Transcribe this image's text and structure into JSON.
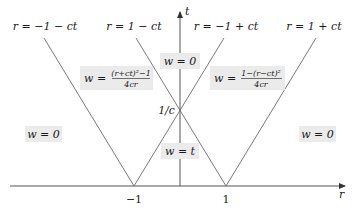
{
  "diagram": {
    "type": "characteristic-lines-diagram",
    "axes": {
      "horizontal": {
        "label": "r",
        "ticks": [
          {
            "value": -1,
            "label": "−1"
          },
          {
            "value": 1,
            "label": "1"
          }
        ]
      },
      "vertical": {
        "label": "t",
        "ticks": [
          {
            "value": "1/c",
            "label": "1/c"
          }
        ]
      }
    },
    "lines": [
      {
        "id": "line-r-eq-minus1-minus-ct",
        "equation": "r = −1 − ct"
      },
      {
        "id": "line-r-eq-1-minus-ct",
        "equation": "r = 1 − ct"
      },
      {
        "id": "line-r-eq-minus1-plus-ct",
        "equation": "r = −1 + ct"
      },
      {
        "id": "line-r-eq-1-plus-ct",
        "equation": "r = 1 + ct"
      }
    ],
    "regions": {
      "left_outer": "w = 0",
      "right_outer": "w = 0",
      "top_center": "w = 0",
      "bottom_center": "w = t",
      "left_wedge": {
        "lhs": "w =",
        "numerator": "(r+ct)²−1",
        "denominator": "4cr"
      },
      "right_wedge": {
        "lhs": "w =",
        "numerator": "1−(r−ct)²",
        "denominator": "4cr"
      }
    },
    "colors": {
      "line": "#6a6a6a",
      "axis": "#555555",
      "label_box": "#ebebeb",
      "text": "#1a1a1a"
    }
  }
}
